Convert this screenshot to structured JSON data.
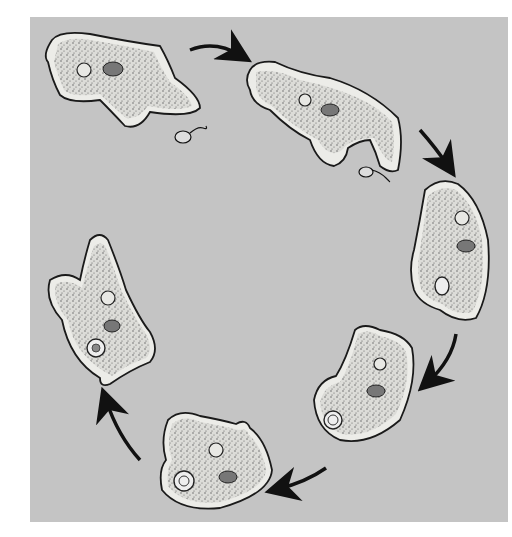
{
  "figure": {
    "background_color": "#c4c4c4",
    "cell_fill": "#e6e6e2",
    "outline_color": "#1a1a1a",
    "stages": [
      {
        "id": 1,
        "description": "amoeba approaching flagellate prey"
      },
      {
        "id": 2,
        "description": "pseudopods extending toward prey"
      },
      {
        "id": 3,
        "description": "pseudopods enclosing prey"
      },
      {
        "id": 4,
        "description": "food vacuole formed"
      },
      {
        "id": 5,
        "description": "food vacuole moving inward"
      },
      {
        "id": 6,
        "description": "digestion within food vacuole"
      }
    ],
    "arrow_count": 6,
    "arrow_direction": "clockwise"
  }
}
